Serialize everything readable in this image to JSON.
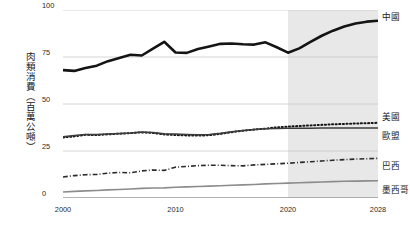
{
  "chart_data": {
    "type": "line",
    "title": "",
    "subtitle": "",
    "xlabel": "",
    "ylabel": "肉類消費（百萬公噸）",
    "xlim": [
      2000,
      2028
    ],
    "ylim": [
      0,
      100
    ],
    "grid": true,
    "legend_position": "right-inline-end-of-line",
    "x_tick_labels": [
      "2000",
      "2010",
      "2020",
      "2028"
    ],
    "x_ticks": [
      2000,
      2010,
      2020,
      2028
    ],
    "y_tick_labels": [
      "0",
      "25",
      "50",
      "75",
      "100"
    ],
    "y_ticks": [
      0,
      25,
      50,
      75,
      100
    ],
    "annotations": [
      {
        "name": "forecast-shading",
        "type": "x-range-band",
        "from": 2020,
        "to": 2028,
        "color": "#e8e8e8",
        "meaning": "projection"
      }
    ],
    "x": [
      2000,
      2001,
      2002,
      2003,
      2004,
      2005,
      2006,
      2007,
      2008,
      2009,
      2010,
      2011,
      2012,
      2013,
      2014,
      2015,
      2016,
      2017,
      2018,
      2019,
      2020,
      2021,
      2022,
      2023,
      2024,
      2025,
      2026,
      2027,
      2028
    ],
    "series": [
      {
        "name": "中國",
        "label": "中國",
        "style": "solid",
        "color": "#141414",
        "width": 2.6,
        "values": [
          68.0,
          67.6,
          69.2,
          70.4,
          72.8,
          74.5,
          76.2,
          75.8,
          79.4,
          83.1,
          77.4,
          77.2,
          79.3,
          80.6,
          82.0,
          82.2,
          81.8,
          81.6,
          82.8,
          80.2,
          77.3,
          79.6,
          83.0,
          86.3,
          89.0,
          91.2,
          92.8,
          93.8,
          94.3
        ]
      },
      {
        "name": "美國",
        "label": "美國",
        "style": "dotted",
        "color": "#141414",
        "width": 2.0,
        "values": [
          32.2,
          32.8,
          33.6,
          33.5,
          33.9,
          34.2,
          34.5,
          34.9,
          34.6,
          33.8,
          33.5,
          33.3,
          33.2,
          33.4,
          34.1,
          35.0,
          35.8,
          36.4,
          36.9,
          37.6,
          38.0,
          38.3,
          38.6,
          38.9,
          39.2,
          39.4,
          39.6,
          39.8,
          40.0
        ]
      },
      {
        "name": "歐盟",
        "label": "歐盟",
        "style": "solid",
        "color": "#3c3c3c",
        "width": 1.5,
        "values": [
          32.6,
          33.2,
          33.8,
          33.8,
          34.0,
          34.3,
          34.6,
          35.1,
          34.8,
          34.2,
          34.0,
          33.8,
          33.6,
          33.8,
          34.4,
          35.2,
          35.9,
          36.4,
          36.8,
          37.0,
          37.1,
          37.1,
          37.1,
          37.2,
          37.2,
          37.2,
          37.3,
          37.3,
          37.3
        ]
      },
      {
        "name": "巴西",
        "label": "巴西",
        "style": "dash-dot",
        "color": "#2b2b2b",
        "width": 1.6,
        "values": [
          11.2,
          11.9,
          12.4,
          12.5,
          13.2,
          13.6,
          13.4,
          14.4,
          14.9,
          14.7,
          16.4,
          16.8,
          17.2,
          17.4,
          17.4,
          17.2,
          17.1,
          17.6,
          17.9,
          18.2,
          18.5,
          18.9,
          19.3,
          19.7,
          20.1,
          20.4,
          20.7,
          20.9,
          21.1
        ]
      },
      {
        "name": "墨西哥",
        "label": "墨西哥",
        "style": "solid",
        "color": "#8c8c8c",
        "width": 1.6,
        "values": [
          3.2,
          3.5,
          3.8,
          4.0,
          4.3,
          4.5,
          4.8,
          5.1,
          5.3,
          5.4,
          5.7,
          5.9,
          6.1,
          6.3,
          6.5,
          6.8,
          7.0,
          7.2,
          7.5,
          7.7,
          7.9,
          8.1,
          8.3,
          8.5,
          8.7,
          8.9,
          9.0,
          9.1,
          9.2
        ]
      }
    ]
  }
}
